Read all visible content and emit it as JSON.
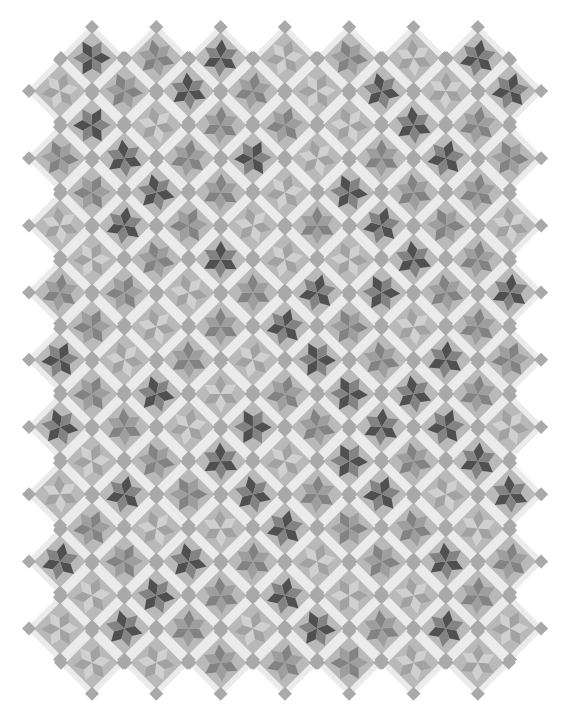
{
  "image": {
    "subject": "Six-pointed star quilt laid on-point with sashing and cornerstones",
    "caption": "Star quilt",
    "width": 570,
    "height": 723,
    "colors": {
      "background": "#ffffff",
      "sashing": "#ebebeb",
      "block": "#b9b9b9",
      "cornerstone": "#a9a9a9",
      "star_dark": "#4a4a4a",
      "star_medium": "#7f7f7f",
      "star_light": "#9c9c9c",
      "star_accent": "#d6d6d6"
    }
  },
  "layout": {
    "pitch_x": 64.3,
    "pitch_y": 67.2,
    "block_half": 26,
    "sash_half": 34,
    "corner_half": 7,
    "row_a": {
      "x0": 92,
      "y0": 58,
      "cols": 7,
      "rows": 10
    },
    "row_b": {
      "x0": 60,
      "y0": 91,
      "cols": 8,
      "rows": 9
    }
  },
  "stars": {
    "row_a": [
      [
        1,
        2,
        1,
        3,
        2,
        3,
        1
      ],
      [
        1,
        3,
        2,
        2,
        3,
        1,
        2
      ],
      [
        2,
        1,
        2,
        3,
        1,
        2,
        2
      ],
      [
        3,
        2,
        1,
        3,
        3,
        1,
        2
      ],
      [
        2,
        3,
        2,
        1,
        2,
        3,
        2
      ],
      [
        2,
        1,
        3,
        2,
        1,
        1,
        2
      ],
      [
        3,
        2,
        1,
        3,
        1,
        2,
        1
      ],
      [
        2,
        3,
        3,
        1,
        2,
        2,
        3
      ],
      [
        3,
        1,
        2,
        1,
        3,
        3,
        2
      ],
      [
        3,
        3,
        2,
        2,
        2,
        3,
        3
      ]
    ],
    "row_b": [
      [
        3,
        2,
        1,
        2,
        3,
        1,
        3,
        1
      ],
      [
        2,
        1,
        2,
        1,
        3,
        2,
        1,
        2
      ],
      [
        3,
        1,
        2,
        3,
        2,
        1,
        2,
        3
      ],
      [
        2,
        2,
        3,
        2,
        1,
        1,
        2,
        1
      ],
      [
        1,
        3,
        2,
        3,
        1,
        2,
        1,
        2
      ],
      [
        1,
        2,
        3,
        1,
        2,
        1,
        1,
        3
      ],
      [
        3,
        1,
        2,
        1,
        2,
        1,
        3,
        1
      ],
      [
        1,
        2,
        1,
        2,
        3,
        2,
        1,
        2
      ],
      [
        3,
        1,
        2,
        3,
        1,
        2,
        1,
        3
      ]
    ]
  }
}
